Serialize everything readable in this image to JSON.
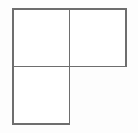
{
  "figure": {
    "type": "line-drawing",
    "background_color": "#fdfdfd",
    "fill_color": "#ffffff",
    "stroke_color": "#6e6e6e",
    "stroke_width": 1.6,
    "canvas": {
      "width": 138,
      "height": 133
    },
    "grid": {
      "columns": 2,
      "rows": 2,
      "cell_width": 56.5,
      "cell_height": 57.5,
      "origin_x": 13,
      "origin_y": 9,
      "mid_x": 69.5,
      "mid_y": 66.5,
      "right_x": 126,
      "bottom_y": 124
    },
    "squares": [
      {
        "name": "top-left-square",
        "position": "top-left",
        "present": true,
        "x": 13,
        "y": 9,
        "width": 56.5,
        "height": 57.5
      },
      {
        "name": "top-right-square",
        "position": "top-right",
        "present": true,
        "x": 69.5,
        "y": 9,
        "width": 56.5,
        "height": 57.5
      },
      {
        "name": "bottom-left-square",
        "position": "bottom-left",
        "present": true,
        "x": 13,
        "y": 66.5,
        "width": 56.5,
        "height": 57.5
      },
      {
        "name": "bottom-right-square",
        "position": "bottom-right",
        "present": false,
        "x": 69.5,
        "y": 66.5,
        "width": 56.5,
        "height": 57.5
      }
    ],
    "segments": [
      {
        "name": "top-edge",
        "x1": 13,
        "y1": 9,
        "x2": 126,
        "y2": 9
      },
      {
        "name": "left-edge",
        "x1": 13,
        "y1": 9,
        "x2": 13,
        "y2": 124
      },
      {
        "name": "right-edge-upper",
        "x1": 126,
        "y1": 9,
        "x2": 126,
        "y2": 66.5
      },
      {
        "name": "middle-horizontal",
        "x1": 13,
        "y1": 66.5,
        "x2": 126,
        "y2": 66.5
      },
      {
        "name": "middle-vertical",
        "x1": 69.5,
        "y1": 9,
        "x2": 69.5,
        "y2": 124
      },
      {
        "name": "bottom-edge-left",
        "x1": 13,
        "y1": 124,
        "x2": 69.5,
        "y2": 124
      }
    ]
  }
}
